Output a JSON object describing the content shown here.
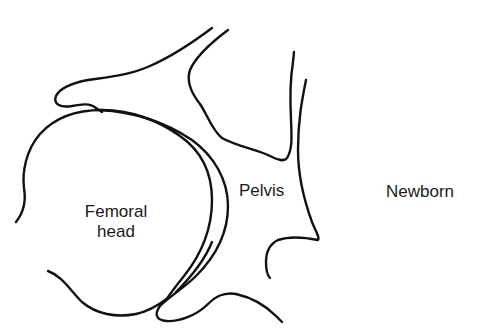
{
  "diagram": {
    "labels": {
      "femoral_head_line1": "Femoral",
      "femoral_head_line2": "head",
      "pelvis": "Pelvis",
      "age": "Newborn"
    },
    "parts": [
      {
        "name": "femoral-head",
        "label": "Femoral head"
      },
      {
        "name": "pelvis",
        "label": "Pelvis"
      },
      {
        "name": "acetabular-cartilage",
        "label": ""
      }
    ],
    "colors": {
      "stroke": "#111111",
      "text": "#1a1a1a",
      "background": "#ffffff"
    }
  }
}
